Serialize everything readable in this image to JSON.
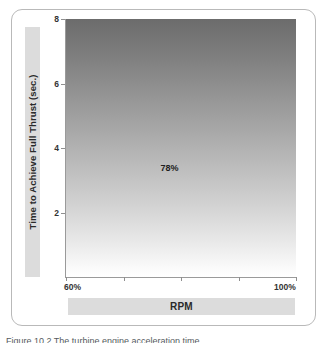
{
  "figure": {
    "caption": "Figure  10.2  The  turbine  engine  acceleration  time",
    "annotation": {
      "label": "78%",
      "x_value": 78,
      "y_top": 3.15,
      "y_bottom": 0.85
    }
  },
  "chart_data": {
    "type": "line",
    "title": "",
    "subtitle": "",
    "xlabel": "RPM",
    "ylabel": "Time to Achieve Full Thrust (sec.)",
    "xlim": [
      60,
      100
    ],
    "ylim": [
      0,
      8
    ],
    "xtick_labels": [
      "60%",
      "100%"
    ],
    "xticks": [
      60,
      70,
      80,
      90,
      100
    ],
    "ytick_labels": [
      "2",
      "4",
      "6",
      "8"
    ],
    "yticks": [
      2,
      4,
      6,
      8
    ],
    "grid": false,
    "legend": false,
    "legend_position": "none",
    "background": "vertical gradient dark grey (top) to white (bottom)",
    "series": [
      {
        "name": "Acceleration time",
        "x": [
          60,
          64,
          68,
          72,
          76,
          78,
          82,
          86,
          90,
          94,
          96,
          97.5,
          98.5,
          99.3,
          100
        ],
        "values": [
          8.0,
          6.65,
          5.3,
          3.95,
          2.6,
          2.0,
          1.72,
          1.44,
          1.16,
          0.86,
          0.7,
          0.56,
          0.42,
          0.25,
          0.0
        ]
      }
    ],
    "annotations": [
      {
        "text": "78%",
        "x": 78,
        "y": 3.4,
        "marker": "vertical dashed line at 78% crossing the curve at 2 sec."
      }
    ],
    "colors": {
      "curve": "#8a8a8a",
      "annotation_line": "#1a1a1a",
      "axis": "#9a9a9a",
      "label_band": "#dcdcdc",
      "gradient_top": "#6c6c6c",
      "gradient_bottom": "#ffffff",
      "card_border": "#b9b9b9",
      "text": "#2a2a2a"
    }
  }
}
